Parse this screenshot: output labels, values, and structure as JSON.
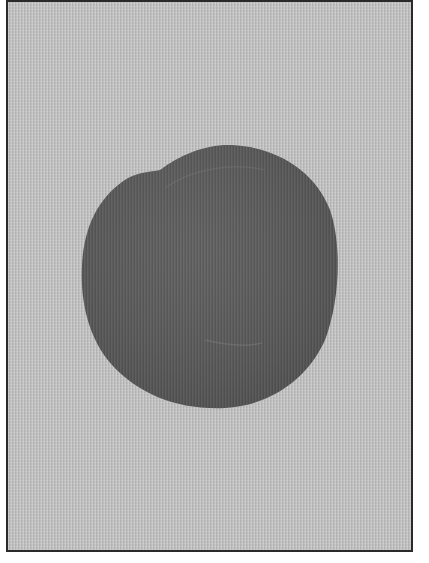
{
  "scene": {
    "description": "Dark gray circular disc on light gray textured paper with thin dark border",
    "colors": {
      "background": "#ffffff",
      "paper": "#c2c2c2",
      "border": "#2a2a2a",
      "disc": "#5a5a5a",
      "disc_highlight": "#6a6a6a"
    },
    "objects": [
      {
        "name": "disc",
        "shape": "circle",
        "center_x": 208,
        "center_y": 276,
        "width": 258,
        "height": 265
      }
    ]
  }
}
